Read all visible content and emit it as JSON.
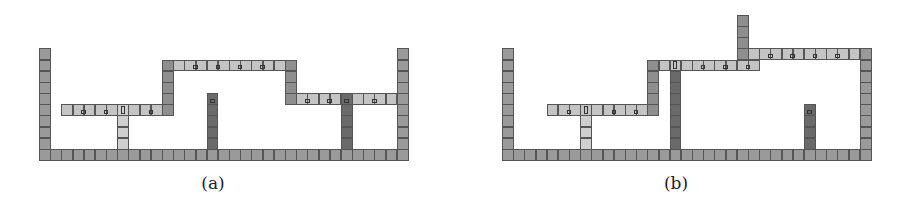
{
  "figure": {
    "cell_size": 11.18,
    "floor_y": 149,
    "colors": {
      "wall": "#9a9a9a",
      "platform": "#c4c4c4",
      "junction": "#8e8e8e",
      "light_pillar": "#cfcfcf",
      "dark_pillar": "#6a6a6a",
      "border": "#555555"
    },
    "panels": [
      {
        "id": "a",
        "caption": "(a)",
        "origin_x": 39,
        "caption_x": 183,
        "segments": [
          {
            "name": "floor",
            "type": "wall",
            "orient": "h",
            "row": 0,
            "from": 0,
            "to": 32
          },
          {
            "name": "left-wall",
            "type": "wall",
            "orient": "v",
            "col": 0,
            "from": 1,
            "to": 9
          },
          {
            "name": "right-wall",
            "type": "wall",
            "orient": "v",
            "col": 32,
            "from": 1,
            "to": 9
          },
          {
            "name": "left-platform",
            "type": "platform",
            "orient": "h",
            "row": 4,
            "from": 2,
            "to": 10
          },
          {
            "name": "left-riser",
            "type": "junction",
            "orient": "v",
            "col": 11,
            "from": 4,
            "to": 7
          },
          {
            "name": "upper-platform",
            "type": "platform",
            "orient": "h",
            "row": 8,
            "from": 12,
            "to": 21
          },
          {
            "name": "upper-left-corner",
            "type": "junction",
            "orient": "v",
            "col": 11,
            "from": 8,
            "to": 8
          },
          {
            "name": "upper-right-corner",
            "type": "junction",
            "orient": "v",
            "col": 22,
            "from": 8,
            "to": 8
          },
          {
            "name": "right-riser",
            "type": "junction",
            "orient": "v",
            "col": 22,
            "from": 5,
            "to": 7
          },
          {
            "name": "right-platform",
            "type": "platform",
            "orient": "h",
            "row": 5,
            "from": 23,
            "to": 31
          },
          {
            "name": "light-pillar",
            "type": "light_pillar",
            "orient": "v",
            "col": 7,
            "from": 1,
            "to": 4
          },
          {
            "name": "dark-pillar-mid",
            "type": "dark_pillar",
            "orient": "v",
            "col": 15,
            "from": 1,
            "to": 5
          },
          {
            "name": "dark-pillar-right",
            "type": "dark_pillar",
            "orient": "v",
            "col": 27,
            "from": 1,
            "to": 5
          }
        ],
        "markers": [
          {
            "col": 3.5,
            "row": 4,
            "kind": "square"
          },
          {
            "col": 5.5,
            "row": 4,
            "kind": "square"
          },
          {
            "col": 7,
            "row": 4,
            "kind": "tall"
          },
          {
            "col": 9.5,
            "row": 4,
            "kind": "square"
          },
          {
            "col": 13.5,
            "row": 8,
            "kind": "square"
          },
          {
            "col": 15.5,
            "row": 8,
            "kind": "square"
          },
          {
            "col": 17.5,
            "row": 8,
            "kind": "square"
          },
          {
            "col": 19.5,
            "row": 8,
            "kind": "square"
          },
          {
            "col": 15,
            "row": 5,
            "kind": "square"
          },
          {
            "col": 23.5,
            "row": 5,
            "kind": "square"
          },
          {
            "col": 25.5,
            "row": 5,
            "kind": "square"
          },
          {
            "col": 27,
            "row": 5,
            "kind": "square"
          },
          {
            "col": 29.5,
            "row": 5,
            "kind": "square"
          }
        ]
      },
      {
        "id": "b",
        "caption": "(b)",
        "origin_x": 502,
        "caption_x": 646,
        "segments": [
          {
            "name": "floor",
            "type": "wall",
            "orient": "h",
            "row": 0,
            "from": 0,
            "to": 32
          },
          {
            "name": "left-wall",
            "type": "wall",
            "orient": "v",
            "col": 0,
            "from": 1,
            "to": 9
          },
          {
            "name": "right-wall",
            "type": "wall",
            "orient": "v",
            "col": 32,
            "from": 1,
            "to": 9
          },
          {
            "name": "left-platform",
            "type": "platform",
            "orient": "h",
            "row": 4,
            "from": 4,
            "to": 12
          },
          {
            "name": "left-riser",
            "type": "junction",
            "orient": "v",
            "col": 13,
            "from": 4,
            "to": 8
          },
          {
            "name": "upper-platform",
            "type": "platform",
            "orient": "h",
            "row": 8,
            "from": 14,
            "to": 22
          },
          {
            "name": "light-pillar",
            "type": "light_pillar",
            "orient": "v",
            "col": 7,
            "from": 1,
            "to": 3
          },
          {
            "name": "dark-column",
            "type": "dark_pillar",
            "orient": "v",
            "col": 15,
            "from": 1,
            "to": 7
          },
          {
            "name": "dark-pillar-right",
            "type": "dark_pillar",
            "orient": "v",
            "col": 27,
            "from": 1,
            "to": 4
          },
          {
            "name": "high-riser",
            "type": "junction",
            "orient": "v",
            "col": 21,
            "from": 9,
            "to": 12
          },
          {
            "name": "high-platform",
            "type": "platform",
            "orient": "h",
            "row": 9,
            "from": 22,
            "to": 31
          }
        ],
        "markers": [
          {
            "col": 5.5,
            "row": 4,
            "kind": "square"
          },
          {
            "col": 7,
            "row": 4,
            "kind": "tall"
          },
          {
            "col": 9.5,
            "row": 4,
            "kind": "square"
          },
          {
            "col": 11.5,
            "row": 4,
            "kind": "square"
          },
          {
            "col": 15,
            "row": 8,
            "kind": "tall"
          },
          {
            "col": 17.5,
            "row": 8,
            "kind": "square"
          },
          {
            "col": 19.5,
            "row": 8,
            "kind": "square"
          },
          {
            "col": 21.5,
            "row": 8,
            "kind": "square"
          },
          {
            "col": 27,
            "row": 4,
            "kind": "square"
          },
          {
            "col": 23.5,
            "row": 9,
            "kind": "square"
          },
          {
            "col": 25.5,
            "row": 9,
            "kind": "square"
          },
          {
            "col": 27.5,
            "row": 9,
            "kind": "square"
          },
          {
            "col": 29.5,
            "row": 9,
            "kind": "square"
          }
        ]
      }
    ]
  }
}
